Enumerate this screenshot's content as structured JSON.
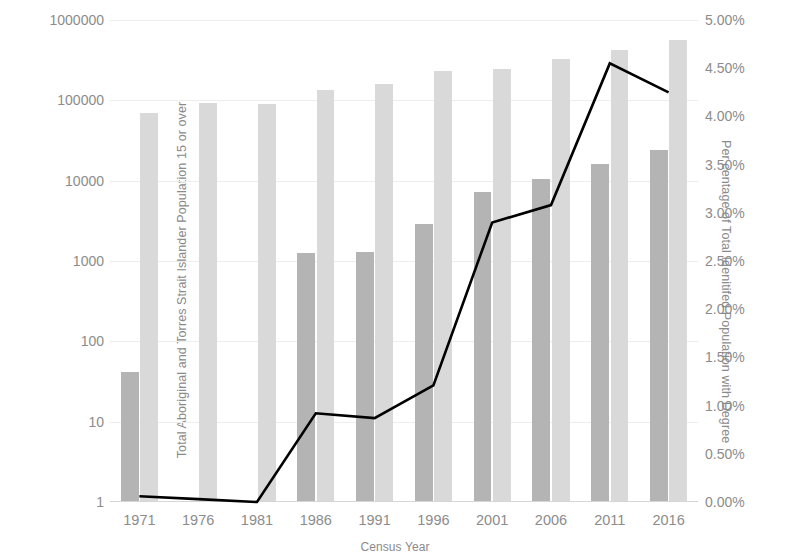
{
  "chart_data": {
    "type": "bar",
    "title": "",
    "xlabel": "Census Year",
    "categories": [
      "1971",
      "1976",
      "1981",
      "1986",
      "1991",
      "1996",
      "2001",
      "2006",
      "2011",
      "2016"
    ],
    "y_left": {
      "label": "Total Aboriginal and Torres Strait Islander Population 15 or over",
      "scale": "log",
      "ylim": [
        1,
        1000000
      ],
      "ticks": [
        "1",
        "10",
        "100",
        "1000",
        "10000",
        "100000",
        "1000000"
      ],
      "tick_values": [
        1,
        10,
        100,
        1000,
        10000,
        100000,
        1000000
      ]
    },
    "y_right": {
      "label": "Per centage of Total Idenitifed Population with Degree",
      "scale": "linear",
      "ylim": [
        0,
        5
      ],
      "ticks": [
        "0.00%",
        "0.50%",
        "1.00%",
        "1.50%",
        "2.00%",
        "2.50%",
        "3.00%",
        "3.50%",
        "4.00%",
        "4.50%",
        "5.00%"
      ],
      "tick_values": [
        0,
        0.5,
        1,
        1.5,
        2,
        2.5,
        3,
        3.5,
        4,
        4.5,
        5
      ]
    },
    "grid": true,
    "legend": "none",
    "series": [
      {
        "name": "Aboriginal and Torres Strait Islander population with degree",
        "type": "bar",
        "axis": "left",
        "color": "#b4b4b4",
        "values": [
          42,
          null,
          null,
          1250,
          1300,
          2900,
          7200,
          10500,
          16000,
          24000
        ]
      },
      {
        "name": "Total Aboriginal and Torres Strait Islander population 15 or over",
        "type": "bar",
        "axis": "left",
        "color": "#d9d9d9",
        "values": [
          70000,
          92000,
          90000,
          135000,
          160000,
          235000,
          245000,
          330000,
          420000,
          560000
        ]
      },
      {
        "name": "Percentage of total identified population with degree",
        "type": "line",
        "axis": "right",
        "color": "#000000",
        "values": [
          0.06,
          0.03,
          0.0,
          0.92,
          0.87,
          1.21,
          2.9,
          3.08,
          4.55,
          4.25
        ]
      }
    ]
  }
}
